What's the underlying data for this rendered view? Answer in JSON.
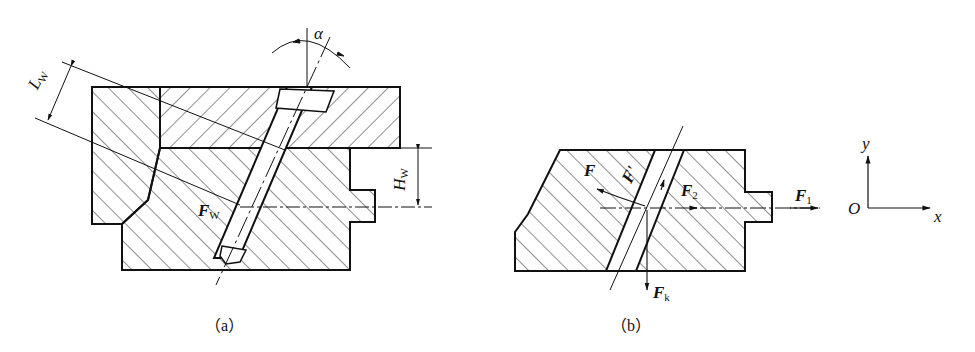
{
  "figure": {
    "panel_a": {
      "caption": "（a）",
      "labels": {
        "angle": "α",
        "Lw_main": "L",
        "Lw_sub": "W",
        "Hw_main": "H",
        "Hw_sub": "W",
        "Fw_main": "F",
        "Fw_sub": "W"
      }
    },
    "panel_b": {
      "caption": "（b）",
      "labels": {
        "F": "F",
        "F_prime": "F'",
        "F2_main": "F",
        "F2_sub": "2",
        "F1_main": "F",
        "F1_sub": "1",
        "Fk_main": "F",
        "Fk_sub": "k"
      }
    },
    "axes": {
      "origin": "O",
      "x": "x",
      "y": "y"
    }
  }
}
